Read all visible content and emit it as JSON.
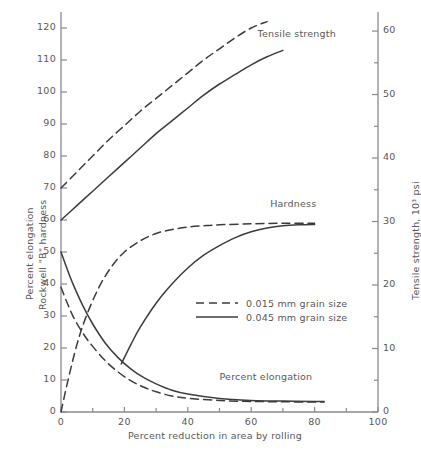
{
  "chart_data": {
    "type": "line",
    "title": "",
    "xlabel": "Percent reduction in area by rolling",
    "ylabel_left_line1": "Percent elongation",
    "ylabel_left_line2": "Rockwell \"B\" hardness",
    "ylabel_right": "Tensile strength, 10³ psi",
    "xlim": [
      0,
      100
    ],
    "xticks": [
      0,
      20,
      40,
      60,
      80,
      100
    ],
    "xminor_step": 10,
    "ylim_left": [
      0,
      125
    ],
    "yticks_left": [
      0,
      10,
      20,
      30,
      40,
      50,
      60,
      70,
      80,
      90,
      100,
      110,
      120
    ],
    "ylim_right": [
      0,
      63
    ],
    "yticks_right": [
      0,
      10,
      20,
      30,
      40,
      50,
      60
    ],
    "yminor_right_step": 5,
    "grid": false,
    "legend_position": "center",
    "legend": [
      {
        "style": "dashed",
        "label": "0.015 mm grain size"
      },
      {
        "style": "solid",
        "label": "0.045 mm grain size"
      }
    ],
    "annotations": [
      {
        "text": "Tensile strength",
        "x": 62,
        "y": 118
      },
      {
        "text": "Hardness",
        "x": 66,
        "y": 65
      },
      {
        "text": "Percent elongation",
        "x": 50,
        "y": 11
      }
    ],
    "series": [
      {
        "name": "Tensile strength, 0.015 mm grain size",
        "axis": "left",
        "style": "dashed",
        "x": [
          0,
          5,
          10,
          15,
          20,
          25,
          30,
          35,
          40,
          45,
          50,
          55,
          60,
          65
        ],
        "y": [
          70,
          75,
          80,
          85,
          89.5,
          94,
          98,
          102,
          106,
          110,
          113.5,
          117,
          120,
          122
        ]
      },
      {
        "name": "Tensile strength, 0.045 mm grain size",
        "axis": "left",
        "style": "solid",
        "x": [
          0,
          5,
          10,
          15,
          20,
          25,
          30,
          35,
          40,
          45,
          50,
          55,
          60,
          65,
          70
        ],
        "y": [
          60,
          64.5,
          69,
          73.5,
          78,
          82.5,
          87,
          91,
          95,
          99,
          102.5,
          105.5,
          108.5,
          111,
          113
        ]
      },
      {
        "name": "Hardness, 0.015 mm grain size",
        "axis": "left",
        "style": "dashed",
        "x": [
          0,
          2,
          5,
          8,
          12,
          16,
          20,
          25,
          30,
          35,
          40,
          45,
          50,
          60,
          70,
          80
        ],
        "y": [
          0,
          9,
          21,
          30,
          39,
          45.5,
          50,
          53.5,
          55.8,
          57,
          57.8,
          58.2,
          58.5,
          58.8,
          59,
          59
        ]
      },
      {
        "name": "Hardness, 0.045 mm grain size",
        "axis": "left",
        "style": "solid",
        "x": [
          19,
          22,
          25,
          30,
          35,
          40,
          45,
          50,
          55,
          60,
          65,
          70,
          75,
          80
        ],
        "y": [
          15,
          21,
          26.5,
          34,
          40,
          45,
          49,
          52,
          54.5,
          56.3,
          57.5,
          58.2,
          58.5,
          58.6
        ]
      },
      {
        "name": "Percent elongation, 0.015 mm grain size",
        "axis": "left",
        "style": "dashed",
        "x": [
          0,
          2,
          4,
          7,
          10,
          14,
          18,
          22,
          26,
          30,
          35,
          40,
          50,
          60,
          70,
          80,
          83
        ],
        "y": [
          39,
          34,
          29.5,
          24.5,
          20.5,
          16,
          12.5,
          9.8,
          7.8,
          6.3,
          5,
          4.3,
          3.6,
          3.3,
          3.2,
          3.1,
          3.1
        ]
      },
      {
        "name": "Percent elongation, 0.045 mm grain size",
        "axis": "left",
        "style": "solid",
        "x": [
          0,
          2,
          4,
          7,
          10,
          14,
          18,
          22,
          26,
          30,
          35,
          40,
          50,
          60,
          70,
          80,
          83
        ],
        "y": [
          50,
          44.5,
          39.5,
          33,
          27.5,
          21.5,
          17,
          13.5,
          10.8,
          8.8,
          6.8,
          5.6,
          4.2,
          3.6,
          3.4,
          3.3,
          3.3
        ]
      }
    ]
  },
  "colors": {
    "axis": "#8a8a8c",
    "curve": "#3c3c3e",
    "text": "#58585a",
    "background": "#ffffff"
  }
}
